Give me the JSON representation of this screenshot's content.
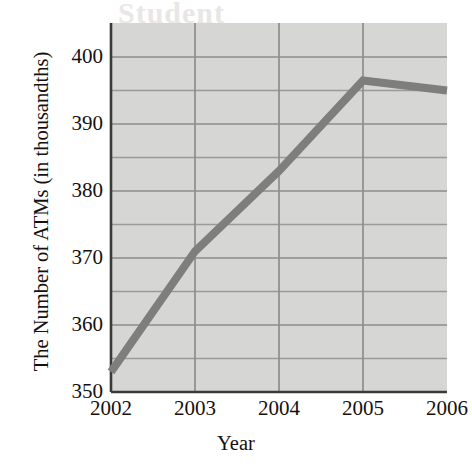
{
  "chart_data": {
    "type": "line",
    "title": "",
    "xlabel": "Year",
    "ylabel": "The Number of ATMs (in thousandths)",
    "categories": [
      "2002",
      "2003",
      "2004",
      "2005",
      "2006"
    ],
    "x": [
      2002,
      2003,
      2004,
      2005,
      2006
    ],
    "values": [
      353,
      371,
      383,
      396.5,
      395
    ],
    "series": [
      {
        "name": "Number of ATMs",
        "values": [
          353,
          371,
          383,
          396.5,
          395
        ]
      }
    ],
    "xlim": [
      2002,
      2006
    ],
    "ylim": [
      350,
      400
    ],
    "ytick_labels": [
      "350",
      "360",
      "370",
      "380",
      "390",
      "400"
    ],
    "ytick_values": [
      350,
      360,
      370,
      380,
      390,
      400
    ],
    "yminor_values": [
      355,
      365,
      375,
      385,
      395
    ],
    "xtick_labels": [
      "2002",
      "2003",
      "2004",
      "2005",
      "2006"
    ],
    "grid": true,
    "legend": "none",
    "colors": {
      "plot_background": "#d6d6d4",
      "gridline": "#8d8d8b",
      "minor_gridline": "#9a9a98",
      "axis": "#3a3a38",
      "series_line": "#7e7e7c",
      "text": "#14110f",
      "page_background": "#ffffff"
    }
  },
  "ghost_text": {
    "top": "Student",
    "mid_left": "",
    "bottom": ""
  }
}
